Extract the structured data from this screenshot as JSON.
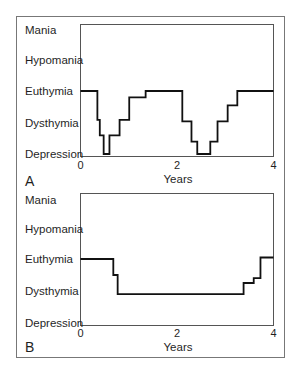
{
  "chart_data": [
    {
      "panel_label": "A",
      "type": "line",
      "step": true,
      "xlabel": "Years",
      "ylabel": "",
      "xlim": [
        0,
        4
      ],
      "x_ticks": [
        "0",
        "2",
        "4"
      ],
      "y_categories": [
        "Depression",
        "Dysthymia",
        "Euthymia",
        "Hypomania",
        "Mania"
      ],
      "ylim": [
        1,
        5
      ],
      "grid": false,
      "series": [
        {
          "name": "mood",
          "x": [
            0,
            0.35,
            0.4,
            0.48,
            0.6,
            0.81,
            1.01,
            1.35,
            2.11,
            2.3,
            2.42,
            2.69,
            2.84,
            3.05,
            3.25,
            4.0
          ],
          "values": [
            3.0,
            2.1,
            1.6,
            1.0,
            1.6,
            2.1,
            2.8,
            3.0,
            2.05,
            1.4,
            1.0,
            1.4,
            2.05,
            2.55,
            3.0,
            3.0
          ]
        }
      ]
    },
    {
      "panel_label": "B",
      "type": "line",
      "step": true,
      "xlabel": "Years",
      "ylabel": "",
      "xlim": [
        0,
        4
      ],
      "x_ticks": [
        "0",
        "2",
        "4"
      ],
      "y_categories": [
        "Depression",
        "Dysthymia",
        "Euthymia",
        "Hypomania",
        "Mania"
      ],
      "ylim": [
        1,
        5
      ],
      "grid": false,
      "series": [
        {
          "name": "mood",
          "x": [
            0,
            0.68,
            0.77,
            3.38,
            3.59,
            3.73,
            4.0
          ],
          "values": [
            3.0,
            2.5,
            1.9,
            2.25,
            2.4,
            3.05,
            3.05
          ]
        }
      ]
    }
  ],
  "colors": {
    "line": "#111111",
    "axis": "#555555",
    "frame": "#777777",
    "text": "#1f1f1f"
  }
}
